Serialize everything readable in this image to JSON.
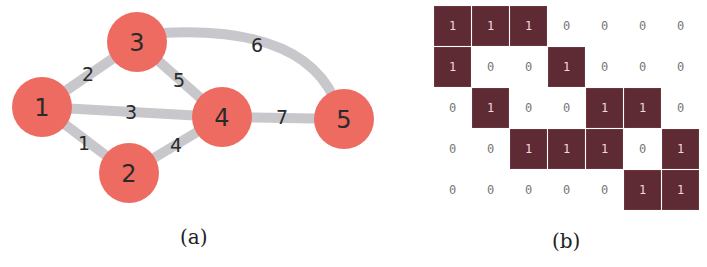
{
  "figure_a": {
    "caption": "(a)",
    "node_color": "#ee6b61",
    "edge_color": "#c8c8cc",
    "nodes": [
      {
        "id": "1",
        "label": "1",
        "x": 42,
        "y": 107
      },
      {
        "id": "2",
        "label": "2",
        "x": 129,
        "y": 173
      },
      {
        "id": "3",
        "label": "3",
        "x": 137,
        "y": 42
      },
      {
        "id": "4",
        "label": "4",
        "x": 222,
        "y": 117
      },
      {
        "id": "5",
        "label": "5",
        "x": 344,
        "y": 119
      }
    ],
    "edges": [
      {
        "label": "1",
        "from": "1",
        "to": "2"
      },
      {
        "label": "2",
        "from": "1",
        "to": "3"
      },
      {
        "label": "3",
        "from": "1",
        "to": "4"
      },
      {
        "label": "4",
        "from": "2",
        "to": "4"
      },
      {
        "label": "5",
        "from": "3",
        "to": "4"
      },
      {
        "label": "6",
        "from": "3",
        "to": "5"
      },
      {
        "label": "7",
        "from": "4",
        "to": "5"
      }
    ]
  },
  "figure_b": {
    "caption": "(b)",
    "cell_color": "#5e2a33",
    "rows": [
      [
        "1",
        "1",
        "1",
        "0",
        "0",
        "0",
        "0"
      ],
      [
        "1",
        "0",
        "0",
        "1",
        "0",
        "0",
        "0"
      ],
      [
        "0",
        "1",
        "0",
        "0",
        "1",
        "1",
        "0"
      ],
      [
        "0",
        "0",
        "1",
        "1",
        "1",
        "0",
        "1"
      ],
      [
        "0",
        "0",
        "0",
        "0",
        "0",
        "1",
        "1"
      ]
    ]
  }
}
